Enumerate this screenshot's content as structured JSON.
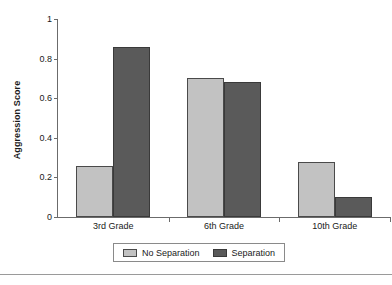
{
  "chart_data": {
    "type": "bar",
    "title": "",
    "subtitle": "",
    "xlabel": "",
    "ylabel": "Aggression Score",
    "categories": [
      "3rd Grade",
      "6th Grade",
      "10th Grade"
    ],
    "series": [
      {
        "name": "No Separation",
        "color": "#c2c2c2",
        "values": [
          0.26,
          0.7,
          0.28
        ]
      },
      {
        "name": "Separation",
        "color": "#5a5a5a",
        "values": [
          0.86,
          0.68,
          0.1
        ]
      }
    ],
    "ylim": [
      0,
      1
    ],
    "yticks": [
      0,
      0.2,
      0.4,
      0.6,
      0.8,
      1
    ],
    "ytick_labels": [
      "0",
      "0.2",
      "0.4",
      "0.6",
      "0.8",
      "1"
    ],
    "grid": false,
    "legend_position": "bottom-center",
    "legend_entries": [
      "No Separation",
      "Separation"
    ],
    "annotations": []
  },
  "figure": {
    "background_color": "#ffffff",
    "axis_color": "#6b6b6b",
    "text_color": "#1a1a1a",
    "bottom_rule_color": "#9a9a9a"
  }
}
